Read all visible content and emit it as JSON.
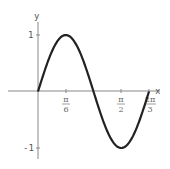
{
  "chart_data": {
    "type": "line",
    "title": "",
    "xlabel": "x",
    "ylabel": "y",
    "function": "sin(3x)",
    "xlim": [
      0,
      2.0944
    ],
    "ylim": [
      -1,
      1
    ],
    "x_ticks": [
      {
        "label": "π/6",
        "num": "π",
        "den": "6",
        "value": 0.5236
      },
      {
        "label": "π/2",
        "num": "π",
        "den": "2",
        "value": 1.5708
      },
      {
        "label": "2π/3",
        "num": "2π",
        "den": "3",
        "value": 2.0944
      }
    ],
    "y_ticks": [
      {
        "label": "1",
        "value": 1
      },
      {
        "label": "-1",
        "value": -1
      }
    ],
    "x": [
      0,
      0.1745,
      0.3491,
      0.5236,
      0.6981,
      0.8727,
      1.0472,
      1.2217,
      1.3963,
      1.5708,
      1.7453,
      1.9199,
      2.0944
    ],
    "y": [
      0,
      0.5,
      0.866,
      1,
      0.866,
      0.5,
      0,
      -0.5,
      -0.866,
      -1,
      -0.866,
      -0.5,
      0
    ],
    "grid": false,
    "legend": null
  },
  "axes": {
    "x_label": "x",
    "y_label": "y",
    "y_tick_1": "1",
    "y_tick_neg1": "-1",
    "xt0_num": "π",
    "xt0_den": "6",
    "xt1_num": "π",
    "xt1_den": "2",
    "xt2_num": "2π",
    "xt2_den": "3"
  },
  "colors": {
    "curve": "#222222",
    "axis": "#888888"
  }
}
